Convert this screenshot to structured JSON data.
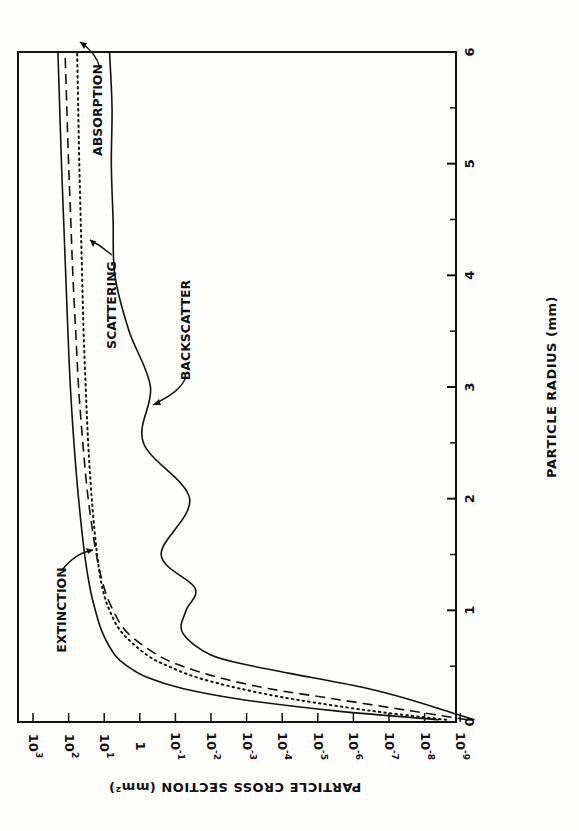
{
  "chart_data": {
    "type": "line",
    "orientation": "rotated-90-ccw",
    "title": "",
    "xlabel": "PARTICLE RADIUS (mm)",
    "ylabel": "PARTICLE CROSS SECTION (mm²)",
    "xlim": [
      0,
      6
    ],
    "ylim_log10": [
      -9.6,
      3
    ],
    "yscale": "log",
    "grid": false,
    "legend": "inline annotations with arrows",
    "x_ticks": [
      "0",
      "1",
      "2",
      "3",
      "4",
      "5",
      "6"
    ],
    "x_minor_ticks": [
      0.5,
      1.5,
      2.5,
      3.5,
      4.5,
      5.5
    ],
    "y_ticks": [
      {
        "label": "10",
        "exp": "3",
        "log": 3
      },
      {
        "label": "10",
        "exp": "2",
        "log": 2
      },
      {
        "label": "10",
        "exp": "1",
        "log": 1
      },
      {
        "label": "1",
        "exp": "",
        "log": 0
      },
      {
        "label": "10",
        "exp": "-1",
        "log": -1
      },
      {
        "label": "10",
        "exp": "-2",
        "log": -2
      },
      {
        "label": "10",
        "exp": "-3",
        "log": -3
      },
      {
        "label": "10",
        "exp": "-4",
        "log": -4
      },
      {
        "label": "10",
        "exp": "-5",
        "log": -5
      },
      {
        "label": "10",
        "exp": "-6",
        "log": -6
      },
      {
        "label": "10",
        "exp": "-7",
        "log": -7
      },
      {
        "label": "10",
        "exp": "-8",
        "log": -8
      },
      {
        "label": "10",
        "exp": "-9",
        "log": -9
      }
    ],
    "x": [
      0.02,
      0.1,
      0.2,
      0.3,
      0.4,
      0.5,
      0.6,
      0.8,
      1.0,
      1.2,
      1.5,
      2.0,
      2.5,
      3.0,
      3.5,
      4.0,
      4.5,
      5.0,
      5.5,
      6.0
    ],
    "series": [
      {
        "name": "EXTINCTION",
        "style": "solid",
        "log10_values": [
          -8.4,
          -5.5,
          -2.9,
          -1.2,
          -0.2,
          0.35,
          0.7,
          1.05,
          1.25,
          1.4,
          1.55,
          1.72,
          1.85,
          1.95,
          2.02,
          2.08,
          2.14,
          2.2,
          2.25,
          2.3
        ]
      },
      {
        "name": "SCATTERING",
        "style": "dashed",
        "log10_values": [
          -9.2,
          -7.6,
          -5.6,
          -3.6,
          -2.2,
          -1.2,
          -0.5,
          0.35,
          0.75,
          1.0,
          1.22,
          1.45,
          1.6,
          1.72,
          1.8,
          1.88,
          1.94,
          2.0,
          2.05,
          2.1
        ]
      },
      {
        "name": "ABSORPTION",
        "style": "dotted",
        "log10_values": [
          -8.6,
          -6.5,
          -4.4,
          -2.8,
          -1.6,
          -0.8,
          -0.2,
          0.5,
          0.85,
          1.05,
          1.2,
          1.35,
          1.45,
          1.52,
          1.58,
          1.62,
          1.66,
          1.7,
          1.73,
          1.76
        ]
      },
      {
        "name": "BACKSCATTER",
        "style": "solid",
        "log10_values": [
          -9.4,
          -8.6,
          -7.6,
          -6.4,
          -4.8,
          -3.2,
          -2.0,
          -1.2,
          -1.3,
          -1.55,
          -0.6,
          -1.4,
          -0.1,
          -0.3,
          0.3,
          0.7,
          0.75,
          0.8,
          0.78,
          0.85
        ]
      }
    ],
    "annotations": [
      {
        "text": "EXTINCTION",
        "points_to": "extinction curve near r≈1.3"
      },
      {
        "text": "SCATTERING",
        "points_to": "scattering curve near r≈4.2"
      },
      {
        "text": "ABSORPTION",
        "points_to": "absorption curve near r≈5.5"
      },
      {
        "text": "BACKSCATTER",
        "points_to": "backscatter curve near r≈2.8"
      }
    ]
  },
  "labels": {
    "xlabel": "PARTICLE RADIUS (mm)",
    "ylabel": "PARTICLE CROSS SECTION (mm²)",
    "extinction": "EXTINCTION",
    "scattering": "SCATTERING",
    "absorption": "ABSORPTION",
    "backscatter": "BACKSCATTER"
  }
}
